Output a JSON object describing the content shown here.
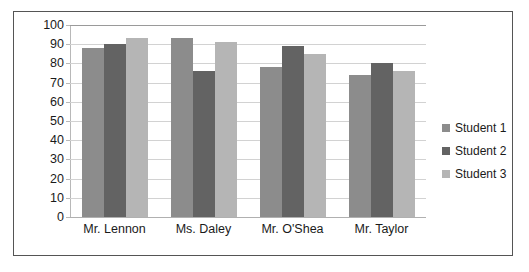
{
  "chart_data": {
    "type": "bar",
    "title": "",
    "xlabel": "",
    "ylabel": "",
    "ylim": [
      0,
      100
    ],
    "ytick_step": 10,
    "yticks": [
      100,
      90,
      80,
      70,
      60,
      50,
      40,
      30,
      20,
      10,
      0
    ],
    "grid": true,
    "legend_position": "right",
    "categories": [
      "Mr. Lennon",
      "Ms. Daley",
      "Mr. O'Shea",
      "Mr. Taylor"
    ],
    "series": [
      {
        "name": "Student 1",
        "color": "#8c8c8c",
        "values": [
          88,
          93,
          78,
          74
        ]
      },
      {
        "name": "Student 2",
        "color": "#636363",
        "values": [
          90,
          76,
          89,
          80
        ]
      },
      {
        "name": "Student 3",
        "color": "#b5b5b5",
        "values": [
          93,
          91,
          85,
          76
        ]
      }
    ]
  },
  "style": {
    "border_color": "#555555",
    "gridline_color": "#d2d2d2",
    "axis_color": "#b8b8b8",
    "text_color": "#1a1a1a",
    "background": "#ffffff"
  }
}
